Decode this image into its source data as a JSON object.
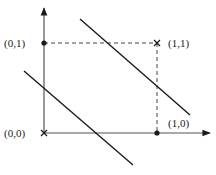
{
  "diagram": {
    "type": "xor-decision-boundaries",
    "colors": {
      "ink": "#1a1a1a",
      "axis": "#555555",
      "dash": "#444444"
    },
    "axes": {
      "origin": {
        "px": [
          44,
          133
        ]
      },
      "x_axis_end": {
        "px": [
          210,
          133
        ]
      },
      "y_axis_end": {
        "px": [
          44,
          8
        ]
      }
    },
    "points": [
      {
        "label": "(0,0)",
        "marker": "cross",
        "px": [
          44,
          133
        ],
        "label_px": [
          4,
          137
        ]
      },
      {
        "label": "(0,1)",
        "marker": "dot",
        "px": [
          44,
          43
        ],
        "label_px": [
          4,
          47
        ]
      },
      {
        "label": "(1,1)",
        "marker": "cross",
        "px": [
          157,
          43
        ],
        "label_px": [
          168,
          47
        ]
      },
      {
        "label": "(1,0)",
        "marker": "dot",
        "px": [
          157,
          133
        ],
        "label_px": [
          168,
          127
        ]
      }
    ],
    "dashed_guides": [
      {
        "from": [
          44,
          43
        ],
        "to": [
          157,
          43
        ]
      },
      {
        "from": [
          157,
          43
        ],
        "to": [
          157,
          133
        ]
      }
    ],
    "boundary_lines": [
      {
        "name": "upper-boundary",
        "from": [
          80,
          19
        ],
        "to": [
          190,
          115
        ]
      },
      {
        "name": "lower-boundary",
        "from": [
          24,
          71
        ],
        "to": [
          133,
          165
        ]
      }
    ]
  }
}
